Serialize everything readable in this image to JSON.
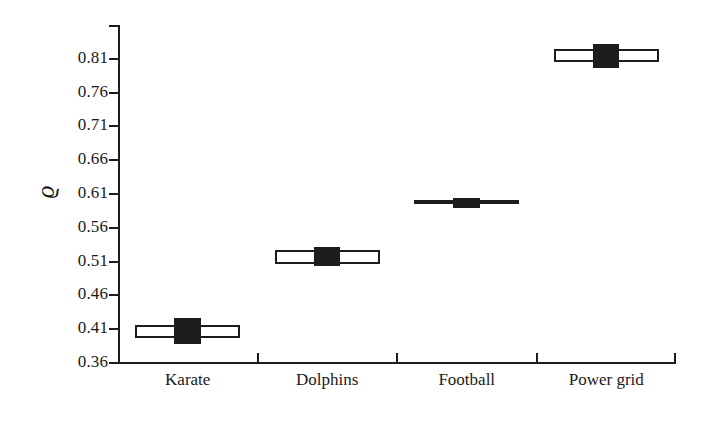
{
  "chart_data": {
    "type": "box",
    "title": "",
    "xlabel": "",
    "ylabel": "ϱ",
    "ylabel_name": "rho",
    "categories": [
      "Karate",
      "Dolphins",
      "Football",
      "Power grid"
    ],
    "ylim": [
      0.36,
      0.86
    ],
    "yticks": [
      0.36,
      0.41,
      0.46,
      0.51,
      0.56,
      0.61,
      0.66,
      0.71,
      0.76,
      0.81
    ],
    "ytick_labels": [
      "0.36",
      "0.41",
      "0.46",
      "0.51",
      "0.56",
      "0.61",
      "0.66",
      "0.71",
      "0.76",
      "0.81"
    ],
    "grid": false,
    "legend": false,
    "series": [
      {
        "name": "Karate",
        "median": 0.407,
        "q1": 0.397,
        "q3": 0.416,
        "marker_low": 0.388,
        "marker_high": 0.426
      },
      {
        "name": "Dolphins",
        "median": 0.515,
        "q1": 0.507,
        "q3": 0.527,
        "marker_low": 0.503,
        "marker_high": 0.531
      },
      {
        "name": "Football",
        "median": 0.597,
        "q1": 0.594,
        "q3": 0.6,
        "marker_low": 0.59,
        "marker_high": 0.604
      },
      {
        "name": "Power grid",
        "median": 0.813,
        "q1": 0.805,
        "q3": 0.825,
        "marker_low": 0.796,
        "marker_high": 0.832
      }
    ]
  },
  "axes": {
    "y_title": "ϱ",
    "tick_labels_y": [
      "0.81",
      "0.76",
      "0.71",
      "0.66",
      "0.61",
      "0.56",
      "0.51",
      "0.46",
      "0.41",
      "0.36"
    ],
    "tick_labels_x": [
      "Karate",
      "Dolphins",
      "Football",
      "Power grid"
    ]
  }
}
